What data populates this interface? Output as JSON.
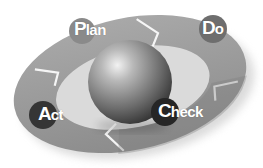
{
  "diagram": {
    "type": "PDCA cycle",
    "colors": {
      "background": "#ffffff",
      "ring": "#9a9a9a",
      "ring_dark": "#7e7e7e",
      "sphere_light": "#e6e6e6",
      "sphere_dark": "#3a3a3a"
    },
    "stages": [
      {
        "id": "plan",
        "label_cap": "P",
        "label_rest": "lan",
        "label": "Plan",
        "circle_color": "#8a8a8a"
      },
      {
        "id": "do",
        "label_cap": "D",
        "label_rest": "o",
        "label": "Do",
        "circle_color": "#6e6e6e"
      },
      {
        "id": "check",
        "label_cap": "C",
        "label_rest": "heck",
        "label": "Check",
        "circle_color": "#262626"
      },
      {
        "id": "act",
        "label_cap": "A",
        "label_rest": "ct",
        "label": "Act",
        "circle_color": "#353535"
      }
    ],
    "center": {
      "shape": "sphere"
    }
  }
}
